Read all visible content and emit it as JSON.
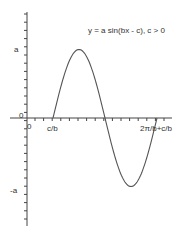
{
  "chart_data": {
    "type": "line",
    "title": "y = a sin(bx - c), c > 0",
    "xlabel": "",
    "ylabel": "",
    "x_tick_labels": [
      "0",
      "c/b",
      "2π/b+c/b"
    ],
    "y_tick_labels": [
      "a",
      "0",
      "-a"
    ],
    "series": [
      {
        "name": "y = a sin(bx - c)",
        "function": "a*sin(b*x - c)",
        "phase_start": "c/b",
        "phase_end": "2π/b+c/b",
        "amplitude": "a",
        "x": [
          "c/b",
          "c/b+π/(2b)",
          "c/b+π/b",
          "c/b+3π/(2b)",
          "2π/b+c/b"
        ],
        "y": [
          0,
          1,
          0,
          -1,
          0
        ]
      }
    ],
    "grid": false,
    "legend": "none",
    "color": "#444444"
  },
  "labels": {
    "equation": "y = a sin(bx - c), c > 0",
    "y_pos": "a",
    "y_neg": "-a",
    "origin_y": "0",
    "origin_x": "0",
    "x_start": "c/b",
    "x_end": "2π/b+c/b"
  }
}
